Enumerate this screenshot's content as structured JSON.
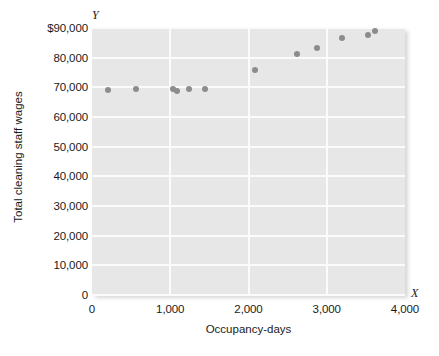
{
  "chart_data": {
    "type": "scatter",
    "title": "",
    "xlabel": "Occupancy-days",
    "ylabel": "Total cleaning staff wages",
    "x_axis_letter": "X",
    "y_axis_letter": "Y",
    "xlim": [
      0,
      4000
    ],
    "ylim": [
      0,
      90000
    ],
    "grid": true,
    "legend": null,
    "point_color": "#8c8c8c",
    "plot_background": "#e7e7e7",
    "gridline_color": "#fbfbfb",
    "xticks": [
      {
        "value": 0,
        "label": "0"
      },
      {
        "value": 1000,
        "label": "1,000"
      },
      {
        "value": 2000,
        "label": "2,000"
      },
      {
        "value": 3000,
        "label": "3,000"
      },
      {
        "value": 4000,
        "label": "4,000"
      }
    ],
    "yticks": [
      {
        "value": 0,
        "label": "0"
      },
      {
        "value": 10000,
        "label": "10,000"
      },
      {
        "value": 20000,
        "label": "20,000"
      },
      {
        "value": 30000,
        "label": "30,000"
      },
      {
        "value": 40000,
        "label": "40,000"
      },
      {
        "value": 50000,
        "label": "50,000"
      },
      {
        "value": 60000,
        "label": "60,000"
      },
      {
        "value": 70000,
        "label": "70,000"
      },
      {
        "value": 80000,
        "label": "80,000"
      },
      {
        "value": 90000,
        "label": "$90,000"
      }
    ],
    "points": [
      {
        "x": 200,
        "y": 69200
      },
      {
        "x": 560,
        "y": 69400
      },
      {
        "x": 1040,
        "y": 69400
      },
      {
        "x": 1090,
        "y": 68600
      },
      {
        "x": 1240,
        "y": 69500
      },
      {
        "x": 1440,
        "y": 69400
      },
      {
        "x": 2080,
        "y": 75800
      },
      {
        "x": 2620,
        "y": 81200
      },
      {
        "x": 2880,
        "y": 83300
      },
      {
        "x": 3200,
        "y": 86500
      },
      {
        "x": 3530,
        "y": 87600
      },
      {
        "x": 3620,
        "y": 88900
      }
    ]
  }
}
